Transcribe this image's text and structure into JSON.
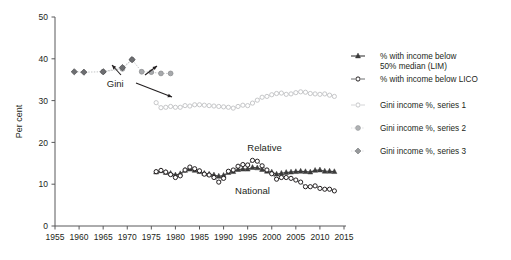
{
  "chart_data": {
    "type": "line",
    "title": "",
    "xlabel": "",
    "ylabel": "Per cent",
    "xlim": [
      1955,
      2015
    ],
    "ylim": [
      0,
      50
    ],
    "xticks": [
      1955,
      1960,
      1965,
      1970,
      1975,
      1980,
      1985,
      1990,
      1995,
      2000,
      2005,
      2010,
      2015
    ],
    "yticks": [
      0,
      10,
      20,
      30,
      40,
      50
    ],
    "grid": false,
    "legend_position": "right",
    "annotations": [
      {
        "text": "Gini",
        "x": 1967.5,
        "y": 33.2
      },
      {
        "text": "Relative",
        "x": 1998.5,
        "y": 18.0
      },
      {
        "text": "National",
        "x": 1996.0,
        "y": 7.6
      }
    ],
    "series": [
      {
        "name": "% with income below 50% median (LIM)",
        "marker": "triangle",
        "color": "#3b3b3b",
        "x": [
          1976,
          1977,
          1978,
          1979,
          1980,
          1981,
          1982,
          1983,
          1984,
          1985,
          1986,
          1987,
          1988,
          1989,
          1990,
          1991,
          1992,
          1993,
          1994,
          1995,
          1996,
          1997,
          1998,
          1999,
          2000,
          2001,
          2002,
          2003,
          2004,
          2005,
          2006,
          2007,
          2008,
          2009,
          2010,
          2011,
          2012,
          2013
        ],
        "values": [
          12.9,
          13.2,
          12.8,
          12.6,
          12.2,
          12.5,
          13.3,
          13.6,
          13.3,
          13.0,
          12.6,
          12.4,
          12.2,
          11.9,
          12.1,
          12.8,
          13.0,
          13.5,
          13.6,
          13.6,
          14.0,
          13.9,
          13.5,
          13.1,
          12.9,
          12.4,
          12.6,
          12.8,
          12.9,
          13.0,
          13.1,
          13.0,
          12.9,
          13.3,
          13.4,
          13.1,
          13.1,
          13.0
        ]
      },
      {
        "name": "% with income below LICO",
        "marker": "circle-open",
        "color": "#231f20",
        "x": [
          1976,
          1977,
          1978,
          1979,
          1980,
          1981,
          1982,
          1983,
          1984,
          1985,
          1986,
          1987,
          1988,
          1989,
          1990,
          1991,
          1992,
          1993,
          1994,
          1995,
          1996,
          1997,
          1998,
          1999,
          2000,
          2001,
          2002,
          2003,
          2004,
          2005,
          2006,
          2007,
          2008,
          2009,
          2010,
          2011,
          2012,
          2013
        ],
        "values": [
          13.0,
          13.3,
          12.9,
          12.3,
          11.6,
          12.0,
          13.4,
          14.1,
          13.7,
          13.2,
          12.4,
          12.2,
          11.6,
          10.5,
          11.4,
          13.1,
          13.4,
          14.3,
          14.7,
          14.6,
          15.7,
          15.5,
          14.4,
          13.4,
          12.5,
          11.2,
          11.6,
          11.6,
          11.4,
          11.0,
          10.5,
          9.4,
          9.4,
          9.6,
          9.0,
          8.8,
          8.8,
          8.4
        ]
      },
      {
        "name": "Gini income %, series 1",
        "marker": "circle-open",
        "color": "#c6c7c9",
        "x": [
          1976,
          1977,
          1978,
          1979,
          1980,
          1981,
          1982,
          1983,
          1984,
          1985,
          1986,
          1987,
          1988,
          1989,
          1990,
          1991,
          1992,
          1993,
          1994,
          1995,
          1996,
          1997,
          1998,
          1999,
          2000,
          2001,
          2002,
          2003,
          2004,
          2005,
          2006,
          2007,
          2008,
          2009,
          2010,
          2011,
          2012,
          2013
        ],
        "values": [
          29.5,
          28.3,
          28.4,
          28.6,
          28.4,
          28.4,
          28.8,
          28.7,
          29.0,
          29.0,
          28.9,
          28.8,
          28.7,
          28.6,
          28.5,
          28.4,
          28.2,
          28.6,
          28.9,
          28.8,
          29.4,
          30.1,
          30.8,
          31.0,
          31.4,
          31.7,
          31.8,
          31.5,
          31.6,
          31.9,
          32.1,
          32.0,
          31.7,
          31.6,
          31.5,
          31.6,
          31.3,
          31.0
        ]
      },
      {
        "name": "Gini income %, series 2",
        "marker": "circle-light",
        "color": "#a7a9ac",
        "x": [
          1965,
          1969,
          1971,
          1973,
          1975,
          1977,
          1979
        ],
        "values": [
          36.9,
          37.6,
          39.8,
          36.9,
          36.8,
          36.5,
          36.5
        ]
      },
      {
        "name": "Gini income %, series 3",
        "marker": "diamond",
        "color": "#6d6e71",
        "x": [
          1959,
          1961,
          1965,
          1969,
          1971
        ],
        "values": [
          36.9,
          36.8,
          36.9,
          37.9,
          39.8
        ]
      }
    ]
  },
  "legend": {
    "items": [
      {
        "label_line1": "% with income below",
        "label_line2": "50% median (LIM)",
        "marker": "triangle-line",
        "color": "#3b3b3b"
      },
      {
        "label_line1": "% with income below LICO",
        "label_line2": "",
        "marker": "circle-open-line",
        "color": "#231f20"
      },
      {
        "label_line1": "Gini income %, series 1",
        "label_line2": "",
        "marker": "circle-open-light",
        "color": "#c6c7c9"
      },
      {
        "label_line1": "Gini income %, series 2",
        "label_line2": "",
        "marker": "circle-light",
        "color": "#b0b2b4"
      },
      {
        "label_line1": "Gini income %, series 3",
        "label_line2": "",
        "marker": "diamond-light",
        "color": "#97999b"
      }
    ]
  },
  "axes": {
    "y_axis_title": "Per cent",
    "y_tick_labels": [
      "0",
      "10",
      "20",
      "30",
      "40",
      "50"
    ],
    "x_tick_labels": [
      "1955",
      "1960",
      "1965",
      "1970",
      "1975",
      "1980",
      "1985",
      "1990",
      "1995",
      "2000",
      "2005",
      "2010",
      "2015"
    ]
  }
}
